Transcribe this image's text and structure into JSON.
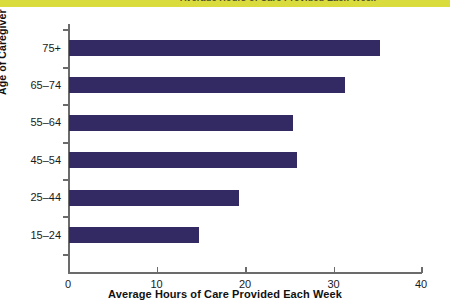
{
  "page": {
    "banner_color": "#d9dc3c",
    "background_color": "#ffffff",
    "clipped_heading_text": "Average Hours of Care Provided Each Week"
  },
  "chart_data": {
    "type": "bar",
    "orientation": "horizontal",
    "title": "",
    "xlabel": "Average Hours of Care Provided Each Week",
    "ylabel": "Age of Caregiver",
    "categories": [
      "15–24",
      "25–44",
      "45–54",
      "55–64",
      "65–74",
      "75+"
    ],
    "values": [
      14.7,
      19.2,
      25.8,
      25.3,
      31.2,
      35.1
    ],
    "xlim": [
      0,
      40
    ],
    "xticks": [
      0,
      10,
      20,
      30,
      40
    ],
    "xtick_labels": [
      "0",
      "10",
      "20",
      "30",
      "40"
    ],
    "grid": false,
    "legend": null,
    "bar_color": "#332a63",
    "axis_color": "#6b6b6b",
    "series": [
      {
        "name": "Average Hours of Care Provided Each Week",
        "points": [
          {
            "category": "75+",
            "value": 35.1
          },
          {
            "category": "65–74",
            "value": 31.2
          },
          {
            "category": "55–64",
            "value": 25.3
          },
          {
            "category": "45–54",
            "value": 25.8
          },
          {
            "category": "25–44",
            "value": 19.2
          },
          {
            "category": "15–24",
            "value": 14.7
          }
        ]
      }
    ]
  }
}
